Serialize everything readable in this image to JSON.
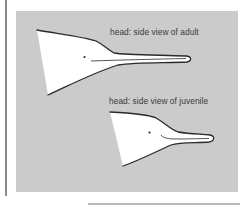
{
  "figure": {
    "background_color": "#cbcbcb",
    "outline_color": "#2a2a2a",
    "fill_color": "#ffffff",
    "labels": {
      "adult": "head: side view of adult",
      "juvenile": "head: side view of juvenile"
    }
  }
}
